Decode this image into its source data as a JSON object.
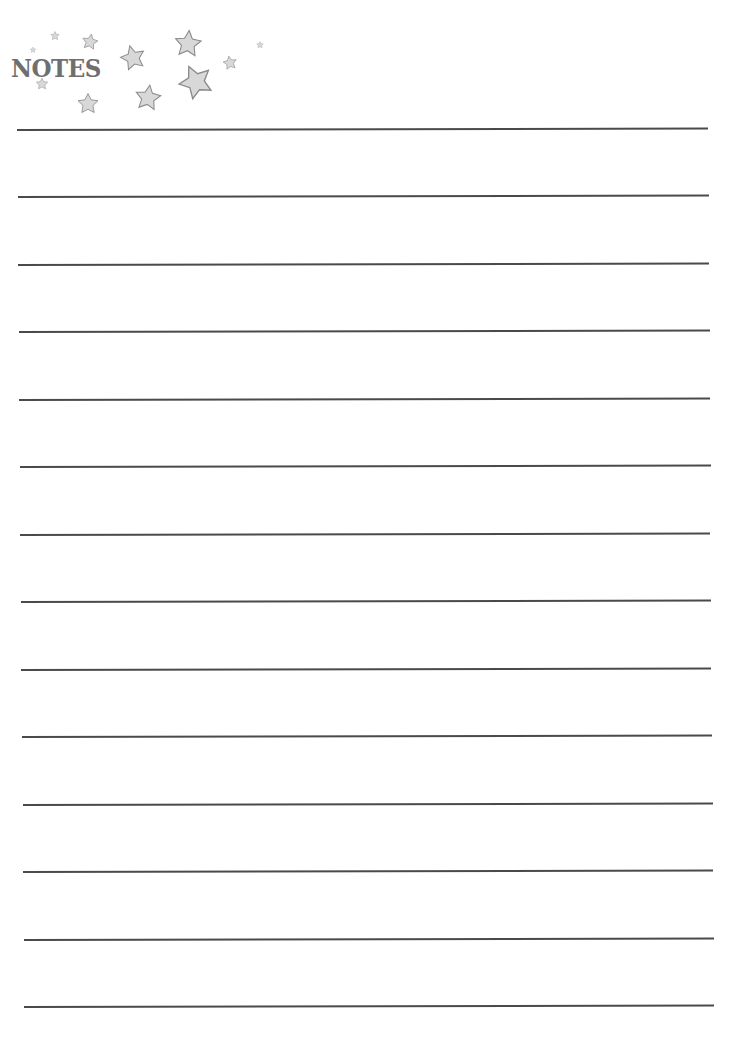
{
  "header": {
    "title": "NOTES",
    "decoration": "star-icon"
  },
  "colors": {
    "line": "#4a4a4a",
    "title": "#6f6f6f",
    "star_fill": "#d8d8d8",
    "star_stroke": "#8a8a8a"
  },
  "lines": [
    {
      "y": 129
    },
    {
      "y": 196
    },
    {
      "y": 264
    },
    {
      "y": 331
    },
    {
      "y": 399
    },
    {
      "y": 466
    },
    {
      "y": 534
    },
    {
      "y": 601
    },
    {
      "y": 669
    },
    {
      "y": 736
    },
    {
      "y": 804
    },
    {
      "y": 871
    },
    {
      "y": 939
    },
    {
      "y": 1006
    }
  ]
}
